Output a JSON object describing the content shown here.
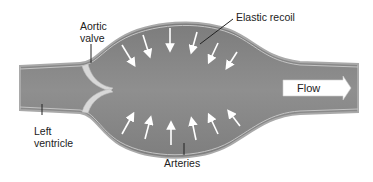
{
  "diagram": {
    "labels": {
      "aortic_valve_line1": "Aortic",
      "aortic_valve_line2": "valve",
      "elastic_recoil": "Elastic recoil",
      "flow": "Flow",
      "left_ventricle_line1": "Left",
      "left_ventricle_line2": "ventricle",
      "arteries": "Arteries"
    },
    "colors": {
      "vessel_fill": "#8a8a8a",
      "vessel_wall": "#b8b8b8",
      "valve": "#d8d8d8",
      "arrows": "#ffffff",
      "leader_lines": "#222222"
    },
    "inward_arrows": {
      "top_count": 6,
      "bottom_count": 6
    }
  }
}
